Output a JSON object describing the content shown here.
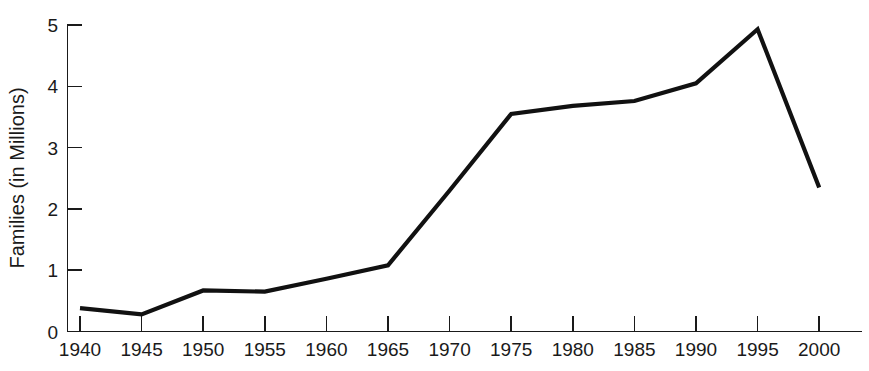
{
  "chart_data": {
    "type": "line",
    "title": "",
    "subtitle": "",
    "xlabel": "",
    "ylabel": "Families (in Millions)",
    "x": [
      1940,
      1945,
      1950,
      1955,
      1960,
      1965,
      1970,
      1975,
      1980,
      1985,
      1990,
      1995,
      2000
    ],
    "xtick_labels": [
      "1940",
      "1945",
      "1950",
      "1955",
      "1960",
      "1965",
      "1970",
      "1975",
      "1980",
      "1985",
      "1990",
      "1995",
      "2000"
    ],
    "values": [
      0.38,
      0.28,
      0.67,
      0.65,
      0.86,
      1.08,
      2.3,
      3.55,
      3.68,
      3.76,
      4.05,
      4.93,
      2.35
    ],
    "series": [
      {
        "name": "Families",
        "values": [
          0.38,
          0.28,
          0.67,
          0.65,
          0.86,
          1.08,
          2.3,
          3.55,
          3.68,
          3.76,
          4.05,
          4.93,
          2.35
        ],
        "color": "#111111"
      }
    ],
    "ytick_labels": [
      "0",
      "1",
      "2",
      "3",
      "4",
      "5"
    ],
    "yticks": [
      0,
      1,
      2,
      3,
      4,
      5
    ],
    "xlim": [
      1940,
      2000
    ],
    "ylim": [
      0,
      5
    ],
    "grid": false,
    "legend": false,
    "legend_position": "none",
    "line_color": "#111111",
    "axis_color": "#1a1a1a",
    "background_color": "#ffffff"
  }
}
